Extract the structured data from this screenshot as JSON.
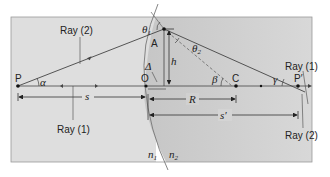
{
  "colors": {
    "background": "#ffffff",
    "panel_n1": "#dcdcdc",
    "panel_n2": "#cfcfcf",
    "line": "#333333",
    "dashed": "#555555"
  },
  "points": {
    "P": "P",
    "A": "A",
    "O": "O",
    "C": "C",
    "P_prime": "P′"
  },
  "rays": {
    "ray2_left": "Ray (2)",
    "ray1_left": "Ray (1)",
    "ray1_right": "Ray (1)",
    "ray2_right": "Ray (2)"
  },
  "angles": {
    "theta1": "θ",
    "theta1_sub": "1",
    "theta2": "θ",
    "theta2_sub": "2",
    "alpha": "α",
    "beta": "β",
    "gamma": "γ",
    "delta": "Δ"
  },
  "distances": {
    "h": "h",
    "s": "s",
    "R": "R",
    "s_prime": "s′"
  },
  "media": {
    "n1": "n",
    "n1_sub": "1",
    "n2": "n",
    "n2_sub": "2"
  }
}
